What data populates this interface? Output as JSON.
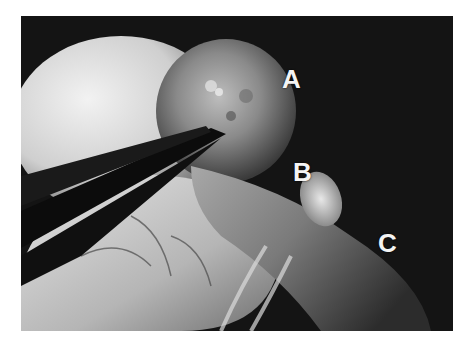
{
  "figure": {
    "labels": [
      {
        "id": "A",
        "text": "A"
      },
      {
        "id": "B",
        "text": "B"
      },
      {
        "id": "C",
        "text": "C"
      }
    ],
    "colors": {
      "background": "#ffffff",
      "photo_dark": "#141414",
      "label_text": "#f4f4f4"
    }
  }
}
